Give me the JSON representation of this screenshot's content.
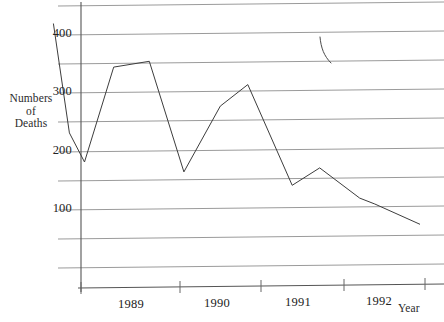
{
  "chart_data": {
    "type": "line",
    "title": "",
    "subtitle": "",
    "xlabel": "Year",
    "ylabel": "Numbers of Deaths",
    "ylabel_lines": [
      "Numbers",
      "of",
      "Deaths"
    ],
    "grid": true,
    "gridline_interval": 50,
    "legend": null,
    "legend_position": "none",
    "xlim": [
      1988.5,
      1993.0
    ],
    "ylim": [
      0,
      450
    ],
    "ytick_labels": [
      "400",
      "300",
      "200",
      "100"
    ],
    "ytick_values": [
      400,
      300,
      200,
      100
    ],
    "gridline_values": [
      450,
      400,
      350,
      300,
      250,
      200,
      150,
      100,
      50,
      0
    ],
    "xtick_labels": [
      "1989",
      "1990",
      "1991",
      "1992"
    ],
    "xtick_values": [
      1989,
      1990,
      1991,
      1992
    ],
    "x": [
      1988.6,
      1988.78,
      1988.95,
      1989.28,
      1989.68,
      1990.07,
      1990.48,
      1990.79,
      1991.29,
      1991.6,
      1992.05,
      1992.22,
      1992.73
    ],
    "values": [
      420,
      232,
      182,
      345,
      355,
      165,
      278,
      315,
      142,
      172,
      120,
      110,
      75
    ],
    "series": [
      {
        "name": "Numbers of Deaths",
        "values": [
          420,
          232,
          182,
          345,
          355,
          165,
          278,
          315,
          142,
          172,
          120,
          110,
          75
        ]
      }
    ],
    "annotations": [
      {
        "name": "stray-pen-mark",
        "description": "small curved ink stroke near upper right of plot area"
      }
    ]
  },
  "axis": {
    "y_label_line1": "Numbers",
    "y_label_line2": "of",
    "y_label_line3": "Deaths",
    "x_label": "Year"
  },
  "colors": {
    "background": "#ffffff",
    "gridline": "#8e8e8e",
    "axis": "#555555",
    "series": "#3d3d3d",
    "text": "#222222"
  }
}
